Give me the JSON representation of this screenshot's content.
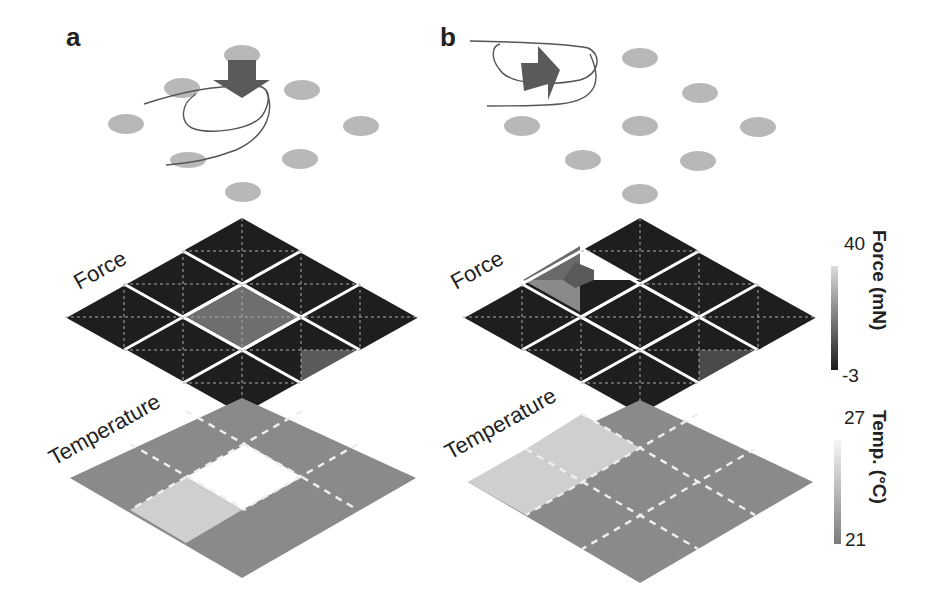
{
  "figure": {
    "panels": [
      {
        "id": "a",
        "label": "a",
        "stimulus": "press (downward force) at center",
        "force_label": "Force",
        "temperature_label": "Temperature",
        "force_grid": [
          [
            "dark",
            "dark",
            "dark"
          ],
          [
            "dark",
            "mid",
            "dark"
          ],
          [
            "dark",
            "dark",
            "dark"
          ]
        ],
        "temperature_grid": [
          [
            "mid",
            "mid",
            "mid"
          ],
          [
            "mid",
            "hot",
            "mid"
          ],
          [
            "light",
            "mid",
            "mid"
          ]
        ]
      },
      {
        "id": "b",
        "label": "b",
        "stimulus": "slide (lateral force) at left corner",
        "force_label": "Force",
        "temperature_label": "Temperature",
        "force_grid": [
          [
            "mixed",
            "dark",
            "dark"
          ],
          [
            "dark",
            "dark",
            "dark"
          ],
          [
            "dark",
            "dark",
            "dark"
          ]
        ],
        "temperature_grid": [
          [
            "light",
            "mid",
            "mid"
          ],
          [
            "light",
            "mid",
            "mid"
          ],
          [
            "mid",
            "mid",
            "mid"
          ]
        ]
      }
    ],
    "colorbars": {
      "force": {
        "title": "Force (mN)",
        "max": "40",
        "min": "-3",
        "color_max": "#d8d8d8",
        "color_min": "#1c1c1c"
      },
      "temperature": {
        "title": "Temp. (°C)",
        "max": "27",
        "min": "21",
        "color_max": "#f4f4f4",
        "color_min": "#7a7a7a"
      }
    },
    "colors": {
      "force_dark": "#1e1e1e",
      "force_mid": "#6e6e6e",
      "temp_mid": "#8a8a8a",
      "temp_light": "#cfcfcf",
      "temp_hot": "#ffffff",
      "sensor_dot": "#b8b8b8",
      "arrow": "#5a5a5a"
    }
  }
}
